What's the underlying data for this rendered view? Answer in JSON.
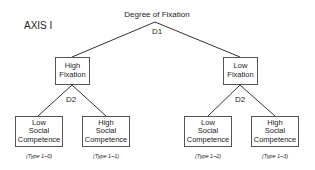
{
  "axis_label": "AXIS I",
  "root": {
    "label": "Degree of Fixation",
    "decision": "D1"
  },
  "level1": [
    {
      "line1": "High",
      "line2": "Fixation",
      "decision": "D2"
    },
    {
      "line1": "Low",
      "line2": "Fixation",
      "decision": "D2"
    }
  ],
  "leaves": [
    {
      "line1": "Low",
      "line2": "Social",
      "line3": "Competence",
      "type": "(Type 1–0)"
    },
    {
      "line1": "High",
      "line2": "Social",
      "line3": "Competence",
      "type": "(Type 1–1)"
    },
    {
      "line1": "Low",
      "line2": "Social",
      "line3": "Competence",
      "type": "(Type 1–2)"
    },
    {
      "line1": "High",
      "line2": "Social",
      "line3": "Competence",
      "type": "(Type 1–3)"
    }
  ],
  "colors": {
    "line": "#333333",
    "box_border": "#555555",
    "text": "#222222"
  }
}
